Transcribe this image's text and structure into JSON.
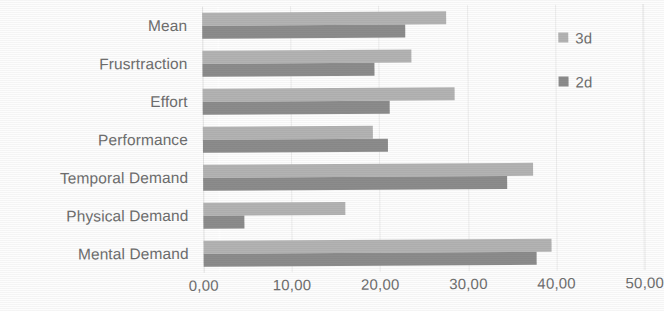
{
  "chart_data": {
    "type": "bar",
    "orientation": "horizontal",
    "title": "",
    "xlabel": "",
    "ylabel": "",
    "categories": [
      "Mental Demand",
      "Physical Demand",
      "Temporal Demand",
      "Performance",
      "Effort",
      "Frusrtraction",
      "Mean"
    ],
    "series": [
      {
        "name": "3d",
        "color": "#b3b3b3",
        "values": [
          39.4,
          16.1,
          37.4,
          19.3,
          28.6,
          23.7,
          27.7
        ]
      },
      {
        "name": "2d",
        "color": "#8c8c8c",
        "values": [
          37.7,
          4.6,
          34.5,
          21.0,
          21.2,
          19.5,
          23.0
        ]
      }
    ],
    "xlim": [
      0,
      50
    ],
    "xticks": [
      0,
      10,
      20,
      30,
      40,
      50
    ],
    "xtick_labels": [
      "0,00",
      "10,00",
      "20,00",
      "30,00",
      "40,00",
      "50,00"
    ],
    "grid": true,
    "grid_axis": "x",
    "legend_position": "right"
  },
  "legend": {
    "items": [
      {
        "label": "3d",
        "color": "#b3b3b3",
        "swatch_name": "legend-swatch-3d"
      },
      {
        "label": "2d",
        "color": "#8c8c8c",
        "swatch_name": "legend-swatch-2d"
      }
    ]
  },
  "colors": {
    "series_3d": "#b3b3b3",
    "series_2d": "#8c8c8c",
    "text": "#6e6e6e",
    "gridline": "#ececec",
    "background": "#fdfdfd"
  }
}
